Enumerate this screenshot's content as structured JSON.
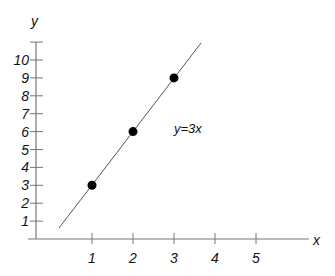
{
  "chart_data": {
    "type": "line",
    "title": "",
    "xlabel": "x",
    "ylabel": "y",
    "x_ticks": [
      1,
      2,
      3,
      4,
      5
    ],
    "y_ticks": [
      1,
      2,
      3,
      4,
      5,
      6,
      7,
      8,
      9,
      10
    ],
    "xlim": [
      0,
      6.5
    ],
    "ylim": [
      0,
      11
    ],
    "grid": false,
    "legend": null,
    "series": [
      {
        "name": "y=3x",
        "type": "line",
        "x": [
          0.55,
          4.0
        ],
        "y": [
          0.65,
          11.0
        ]
      },
      {
        "name": "points",
        "type": "scatter",
        "x": [
          1,
          2,
          3
        ],
        "y": [
          3,
          6,
          9
        ]
      }
    ],
    "annotations": [
      {
        "text": "y=3x",
        "x": 3.3,
        "y": 6
      }
    ]
  },
  "labels": {
    "x_axis": "x",
    "y_axis": "y",
    "equation": "y=3x",
    "x_ticks": [
      "1",
      "2",
      "3",
      "4",
      "5"
    ],
    "y_ticks": [
      "1",
      "2",
      "3",
      "4",
      "5",
      "6",
      "7",
      "8",
      "9",
      "10"
    ]
  }
}
